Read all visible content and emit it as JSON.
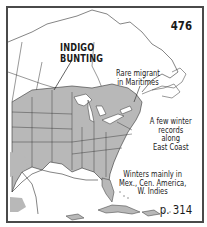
{
  "map": {
    "species_number": "476",
    "species_name_lines": [
      "INDIGO",
      "BUNTING"
    ],
    "page_ref": "p. 314",
    "range_color": "#b8b8b8",
    "water_color": "#ffffff",
    "border_color": "#4a4a4a",
    "annotations": [
      {
        "id": "maritimes",
        "lines": [
          "Rare migrant",
          "in Maritimes"
        ]
      },
      {
        "id": "east-coast",
        "lines": [
          "A few winter",
          "records along",
          "East Coast"
        ]
      },
      {
        "id": "winter-range",
        "lines": [
          "Winters mainly in",
          "Mex., Cen. America,",
          "W. Indies"
        ]
      }
    ]
  }
}
